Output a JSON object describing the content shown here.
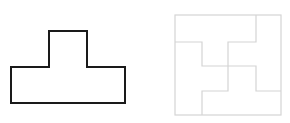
{
  "diagram": {
    "left_shape": {
      "name": "T-shape",
      "stroke": "#1a1a1a",
      "points": "11,67 49,67 49,31 87,31 87,67 125,67 125,103 11,103"
    },
    "right_shape": {
      "name": "square-divided-into-pieces",
      "stroke": "#d4d4d4",
      "outer": {
        "x": 175,
        "y": 15,
        "width": 106,
        "height": 100
      },
      "inner_lines": [
        "256,15 256,42 228,42 228,91 202,91 202,115",
        "175,42 202,42 202,66 256,66 256,91 281,91"
      ]
    }
  }
}
